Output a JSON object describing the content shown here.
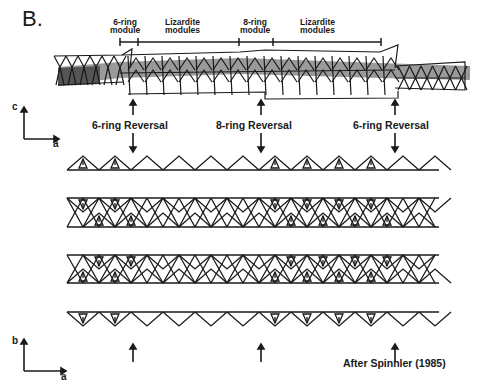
{
  "figure": {
    "panel_label": "B.",
    "module_labels": [
      {
        "text_1": "6-ring",
        "text_2": "module"
      },
      {
        "text_1": "Lizardite",
        "text_2": "modules"
      },
      {
        "text_1": "8-ring",
        "text_2": "module"
      },
      {
        "text_1": "Lizardite",
        "text_2": "modules"
      }
    ],
    "scale_bar": {
      "y": 42,
      "x_start": 120,
      "x_end": 381,
      "ticks": [
        120,
        138,
        239,
        273,
        381
      ]
    },
    "reversal_labels": [
      "6-ring Reversal",
      "8-ring Reversal",
      "6-ring Reversal"
    ],
    "axes_top": {
      "vertical": "c",
      "horizontal": "a"
    },
    "axes_bottom": {
      "vertical": "b",
      "horizontal": "a"
    },
    "credit": "After Spinnler (1985)",
    "colors": {
      "ink": "#1a1a1a",
      "shade": "#9a9a9a",
      "shade_dark": "#555555",
      "background": "#ffffff"
    },
    "lattice": {
      "x_left": 67,
      "x_right": 439,
      "period": 32,
      "row_lines": [
        170,
        198,
        227,
        255,
        283,
        312
      ],
      "reversal_x": [
        133,
        261,
        395
      ],
      "module_8ring_range": [
        261,
        395
      ]
    }
  }
}
